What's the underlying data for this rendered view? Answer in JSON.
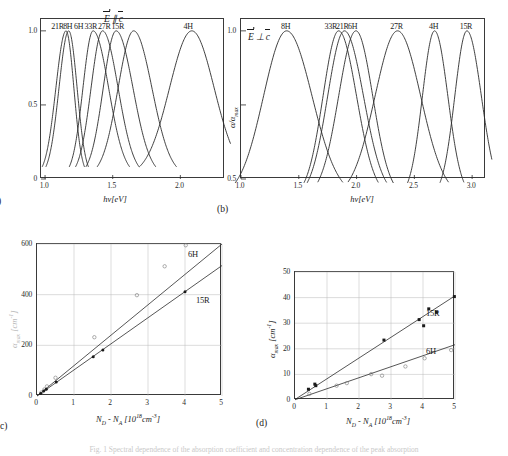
{
  "figure": {
    "caption": "Fig. 1 Spectral dependence of the absorption coefficient and concentration dependence of the peak absorption"
  },
  "panels": {
    "a": {
      "tag": "(a)",
      "polarization": "E ∥ c",
      "xlabel": "hν[eV]",
      "ylabel": "",
      "xticks": [
        "1.0",
        "1.5",
        "2.0"
      ],
      "yticks": [
        "0",
        "0.5",
        "1.0"
      ],
      "curve_labels": [
        "21R",
        "8H",
        "6H",
        "33R",
        "27R",
        "15R",
        "4H"
      ]
    },
    "b": {
      "tag": "(b)",
      "polarization": "E ⊥ c",
      "xlabel": "hν[eV]",
      "ylabel": "α/αmax",
      "xticks": [
        "1.0",
        "1.5",
        "2.0",
        "2.5",
        "3.0"
      ],
      "yticks": [
        "0.5",
        "1.0"
      ],
      "curve_labels": [
        "8H",
        "33R",
        "21R",
        "6H",
        "27R",
        "4H",
        "15R"
      ]
    },
    "c": {
      "tag": "c)",
      "xlabel_main": "N",
      "xlabel_sub1": "D",
      "xlabel_mid": " - N",
      "xlabel_sub2": "A",
      "xlabel_unit": " [10",
      "xlabel_exp": "18",
      "xlabel_unit2": "cm",
      "xlabel_exp2": "-3",
      "xlabel_close": "]",
      "ylabel": "αmax [cm-1]",
      "xticks": [
        "0",
        "1",
        "2",
        "3",
        "4",
        "5"
      ],
      "yticks": [
        "0",
        "200",
        "400",
        "600"
      ],
      "series_labels": [
        "6H",
        "15R"
      ]
    },
    "d": {
      "tag": "(d)",
      "xlabel_main": "N",
      "xlabel_sub1": "D",
      "xlabel_mid": " - N",
      "xlabel_sub2": "A",
      "xlabel_unit": " [10",
      "xlabel_exp": "18",
      "xlabel_unit2": "cm",
      "xlabel_exp2": "-3",
      "xlabel_close": "]",
      "ylabel_alpha": "α",
      "ylabel_sub": "max",
      "ylabel_unit": " [cm",
      "ylabel_exp": "-1",
      "ylabel_close": "]",
      "xticks": [
        "0",
        "1",
        "2",
        "3",
        "4",
        "5"
      ],
      "yticks": [
        "0",
        "10",
        "20",
        "30",
        "40",
        "50"
      ],
      "series_labels": [
        "15R",
        "6H"
      ]
    }
  },
  "chart_data": [
    {
      "type": "line",
      "id": "panel-a",
      "title": "",
      "xlabel": "hν [eV]",
      "ylabel": "α/αmax",
      "xlim": [
        0.97,
        2.33
      ],
      "ylim": [
        0,
        1.08
      ],
      "grid": false,
      "legend": "inline-above-peaks",
      "annotation": "E ∥ c",
      "series": [
        {
          "name": "21R",
          "peak_x": 1.155,
          "peak_y": 1.0,
          "width_left": 0.075,
          "width_right": 0.058,
          "label_x": 1.1
        },
        {
          "name": "8H",
          "peak_x": 1.175,
          "peak_y": 1.0,
          "width_left": 0.072,
          "width_right": 0.062,
          "label_x": 1.175
        },
        {
          "name": "6H",
          "peak_x": 1.355,
          "peak_y": 1.0,
          "width_left": 0.075,
          "width_right": 0.115,
          "label_x": 1.255
        },
        {
          "name": "33R",
          "peak_x": 1.425,
          "peak_y": 1.0,
          "width_left": 0.085,
          "width_right": 0.115,
          "label_x": 1.345
        },
        {
          "name": "27R",
          "peak_x": 1.525,
          "peak_y": 1.0,
          "width_left": 0.095,
          "width_right": 0.125,
          "label_x": 1.445
        },
        {
          "name": "15R",
          "peak_x": 1.655,
          "peak_y": 1.0,
          "width_left": 0.115,
          "width_right": 0.135,
          "label_x": 1.545
        },
        {
          "name": "4H",
          "peak_x": 2.085,
          "peak_y": 1.0,
          "width_left": 0.165,
          "width_right": 0.165,
          "label_x": 2.065
        }
      ]
    },
    {
      "type": "line",
      "id": "panel-b",
      "title": "",
      "xlabel": "hν [eV]",
      "ylabel": "α/αmax",
      "xlim": [
        1.0,
        3.12
      ],
      "ylim": [
        0.5,
        1.04
      ],
      "grid": false,
      "legend": "inline-above-peaks",
      "annotation": "E ⊥ c",
      "series": [
        {
          "name": "8H",
          "peak_x": 1.395,
          "peak_y": 1.0,
          "width_left": 0.2,
          "width_right": 0.22,
          "label_x": 1.395
        },
        {
          "name": "33R",
          "peak_x": 1.845,
          "peak_y": 1.0,
          "width_left": 0.135,
          "width_right": 0.155,
          "label_x": 1.785
        },
        {
          "name": "21R",
          "peak_x": 1.895,
          "peak_y": 1.0,
          "width_left": 0.145,
          "width_right": 0.165,
          "label_x": 1.885
        },
        {
          "name": "6H",
          "peak_x": 1.995,
          "peak_y": 1.0,
          "width_left": 0.15,
          "width_right": 0.145,
          "label_x": 1.975
        },
        {
          "name": "27R",
          "peak_x": 2.355,
          "peak_y": 1.0,
          "width_left": 0.195,
          "width_right": 0.2,
          "label_x": 2.355
        },
        {
          "name": "4H",
          "peak_x": 2.675,
          "peak_y": 1.0,
          "width_left": 0.105,
          "width_right": 0.115,
          "label_x": 2.675
        },
        {
          "name": "15R",
          "peak_x": 2.955,
          "peak_y": 1.0,
          "width_left": 0.105,
          "width_right": 0.125,
          "label_x": 2.955
        }
      ]
    },
    {
      "type": "scatter",
      "id": "panel-c",
      "title": "",
      "xlabel": "N_D - N_A [10^18 cm^-3]",
      "ylabel": "αmax [cm^-1]",
      "xlim": [
        0,
        5
      ],
      "ylim": [
        0,
        600
      ],
      "grid": true,
      "series": [
        {
          "name": "6H",
          "marker": "open-circle",
          "fit_slope": 148,
          "fit_intercept": 0,
          "points": [
            {
              "x": 0.12,
              "y": 14
            },
            {
              "x": 0.2,
              "y": 26
            },
            {
              "x": 0.27,
              "y": 38
            },
            {
              "x": 0.5,
              "y": 72
            },
            {
              "x": 1.55,
              "y": 232
            },
            {
              "x": 2.7,
              "y": 398
            },
            {
              "x": 3.45,
              "y": 512
            },
            {
              "x": 4.02,
              "y": 595
            }
          ]
        },
        {
          "name": "15R",
          "marker": "filled-circle",
          "fit_slope": 103,
          "fit_intercept": 0,
          "points": [
            {
              "x": 0.1,
              "y": 10
            },
            {
              "x": 0.18,
              "y": 20
            },
            {
              "x": 0.25,
              "y": 27
            },
            {
              "x": 0.52,
              "y": 55
            },
            {
              "x": 1.52,
              "y": 155
            },
            {
              "x": 1.78,
              "y": 182
            },
            {
              "x": 4.0,
              "y": 412
            }
          ]
        }
      ]
    },
    {
      "type": "scatter",
      "id": "panel-d",
      "title": "",
      "xlabel": "N_D - N_A [10^18 cm^-3]",
      "ylabel": "αmax [cm^-1]",
      "xlim": [
        0,
        5
      ],
      "ylim": [
        0,
        50
      ],
      "grid": true,
      "series": [
        {
          "name": "15R",
          "marker": "filled-square",
          "fit_slope": 8.1,
          "fit_intercept": 0.2,
          "points": [
            {
              "x": 0.42,
              "y": 4.2
            },
            {
              "x": 0.62,
              "y": 6.2
            },
            {
              "x": 0.65,
              "y": 5.6
            },
            {
              "x": 2.78,
              "y": 23.4
            },
            {
              "x": 3.88,
              "y": 31.4
            },
            {
              "x": 4.02,
              "y": 29.0
            },
            {
              "x": 4.18,
              "y": 35.6
            },
            {
              "x": 4.42,
              "y": 34.3
            },
            {
              "x": 4.98,
              "y": 40.4
            }
          ]
        },
        {
          "name": "6H",
          "marker": "open-circle",
          "fit_slope": 4.3,
          "fit_intercept": 0.1,
          "points": [
            {
              "x": 0.45,
              "y": 2.4
            },
            {
              "x": 1.3,
              "y": 5.6
            },
            {
              "x": 1.62,
              "y": 6.6
            },
            {
              "x": 2.38,
              "y": 10.1
            },
            {
              "x": 2.72,
              "y": 9.5
            },
            {
              "x": 3.45,
              "y": 13.1
            },
            {
              "x": 4.05,
              "y": 16.3
            },
            {
              "x": 4.88,
              "y": 19.5
            }
          ]
        }
      ]
    }
  ]
}
